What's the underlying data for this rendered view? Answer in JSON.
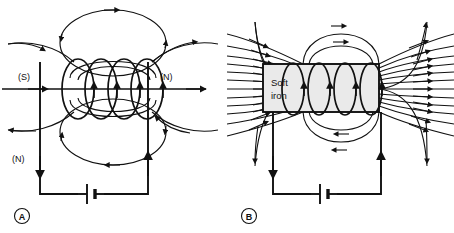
{
  "figure": {
    "background_color": "#ffffff",
    "line_color": "#111111",
    "core_fill_color": "#eaeaea"
  },
  "panels": [
    {
      "letter": "A",
      "name": "air-core-solenoid",
      "description": "Solenoid without core: magnetic field spreads in wide elliptical loops",
      "pole_labels": [
        {
          "text": "(S)",
          "position": "axis-left"
        },
        {
          "text": "(N)",
          "position": "axis-right"
        },
        {
          "text": "(N)",
          "position": "lower-left"
        }
      ],
      "coil_turns": 4,
      "has_core": false,
      "has_battery": true,
      "axis_arrow": "right"
    },
    {
      "letter": "B",
      "name": "soft-iron-core-solenoid",
      "description": "Solenoid with soft iron core: field lines concentrated and intensified",
      "core_label_line1": "Soft",
      "core_label_line2": "iron",
      "pole_labels": [],
      "coil_turns": 4,
      "has_core": true,
      "has_battery": true,
      "flux_lines_left": 11,
      "flux_lines_right": 11
    }
  ]
}
